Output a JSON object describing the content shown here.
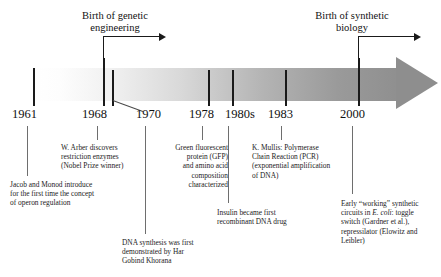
{
  "figure": {
    "type": "timeline",
    "orientation": "horizontal",
    "title_visible": false
  },
  "headers": [
    {
      "id": "genetic-engineering",
      "text": "Birth of genetic\nengineering",
      "anchor_year": "1968"
    },
    {
      "id": "synthetic-biology",
      "text": "Birth of synthetic\nbiology",
      "anchor_year": "2000"
    }
  ],
  "axis": {
    "years": [
      {
        "label": "1961",
        "x": 33
      },
      {
        "label": "1968",
        "x": 103
      },
      {
        "label": "1970",
        "x": 142
      },
      {
        "label": "1978",
        "x": 208
      },
      {
        "label": "1980s",
        "x": 245
      },
      {
        "label": "1983",
        "x": 285
      },
      {
        "label": "2000",
        "x": 358
      }
    ]
  },
  "events": [
    {
      "id": "operon",
      "year": "1961",
      "text": "Jacob and Monod introduce\nfor the first time the concept\nof operon regulation"
    },
    {
      "id": "restriction-enzymes",
      "year": "1968",
      "text": "W. Arber discovers\nrestriction enzymes\n(Nobel Prize winner)"
    },
    {
      "id": "dna-synthesis",
      "year": "1970",
      "text": "DNA synthesis was first\ndemonstrated by Har\nGobind Khorana"
    },
    {
      "id": "gfp",
      "year": "1978",
      "text": "Green fluorescent\nprotein (GFP)\nand amino acid\ncomposition\ncharacterized"
    },
    {
      "id": "insulin",
      "year": "1980s",
      "text": "Insulin became first\nrecombinant DNA drug"
    },
    {
      "id": "pcr",
      "year": "1983",
      "text": "K. Mullis: Polymerase\nChain Reaction (PCR)\n(exponential amplification\nof DNA)"
    },
    {
      "id": "synthetic-circuits",
      "year": "2000",
      "text_parts": [
        "Early “working” synthetic",
        "circuits in ",
        "E. coli",
        ": toggle",
        "switch (Gardner et al.),",
        "repressilator (Elowitz and",
        "Leibler)"
      ]
    }
  ],
  "colors": {
    "band_start": "#ffffff",
    "band_end": "#8e8e8e",
    "tick": "#1a1a1a",
    "text": "#1c1c1c"
  }
}
